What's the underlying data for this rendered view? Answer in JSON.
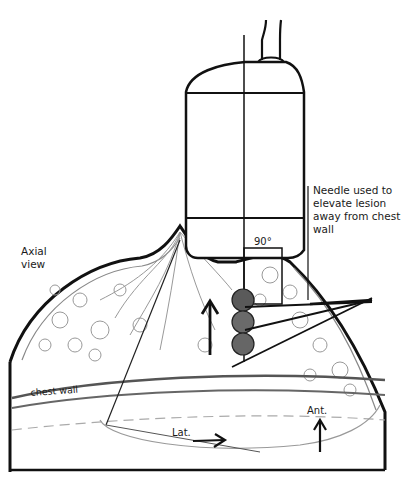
{
  "figure": {
    "type": "medical illustration",
    "style": "pencil sketch, grayscale",
    "colors": {
      "ink": "#1a1a1a",
      "shade": "#8a8a8a",
      "background": "#ffffff"
    }
  },
  "labels": {
    "needle_note": "Needle used to elevate lesion away from chest wall",
    "axial_view": "Axial view",
    "angle": "90°",
    "chest_wall": "chest wall",
    "lateral": "Lat.",
    "anterior": "Ant."
  },
  "elements": {
    "transducer": "ultrasound transducer probe",
    "lesion": "lesion (three stacked nodules)",
    "needles": 3,
    "arrows": [
      "upward arrow (elevation)",
      "lateral arrow",
      "anterior arrow"
    ]
  }
}
